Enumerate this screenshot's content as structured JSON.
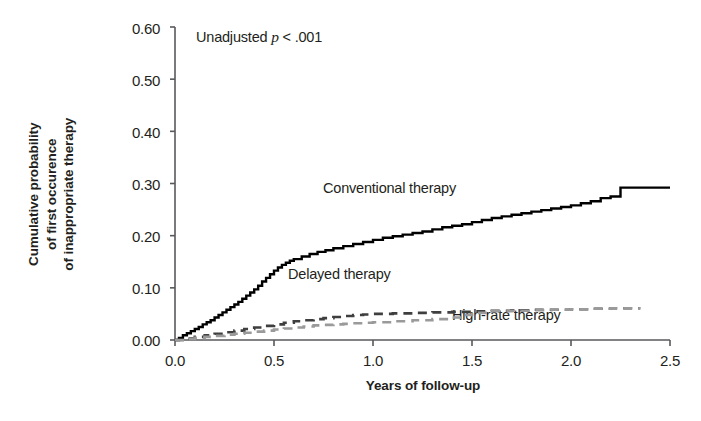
{
  "chart_data": {
    "type": "line",
    "title": "",
    "xlabel": "Years of follow-up",
    "ylabel": "Cumulative probability of first occurence of inappropriate therapy",
    "ylabel_lines": [
      "Cumulative probability",
      "of first occurence",
      "of inappropriate therapy"
    ],
    "xlim": [
      0.0,
      2.5
    ],
    "ylim": [
      0.0,
      0.6
    ],
    "xticks": [
      "0.0",
      "0.5",
      "1.0",
      "1.5",
      "2.0",
      "2.5"
    ],
    "xtick_values": [
      0.0,
      0.5,
      1.0,
      1.5,
      2.0,
      2.5
    ],
    "yticks": [
      "0.00",
      "0.10",
      "0.20",
      "0.30",
      "0.40",
      "0.50",
      "0.60"
    ],
    "ytick_values": [
      0.0,
      0.1,
      0.2,
      0.3,
      0.4,
      0.5,
      0.6
    ],
    "grid": false,
    "legend_position": "inline-annotations",
    "annotations": [
      {
        "id": "pvalue",
        "text_prefix": "Unadjusted ",
        "text_italic": "p",
        "text_suffix": " < .001"
      }
    ],
    "series": [
      {
        "name": "Conventional therapy",
        "style": "solid",
        "color": "#000000",
        "label_x": 1.27,
        "label_y": 0.335,
        "x": [
          0.0,
          0.02,
          0.04,
          0.06,
          0.08,
          0.1,
          0.12,
          0.14,
          0.16,
          0.18,
          0.2,
          0.22,
          0.24,
          0.26,
          0.28,
          0.3,
          0.32,
          0.34,
          0.36,
          0.38,
          0.4,
          0.42,
          0.44,
          0.46,
          0.48,
          0.5,
          0.52,
          0.54,
          0.56,
          0.58,
          0.6,
          0.64,
          0.68,
          0.72,
          0.76,
          0.8,
          0.85,
          0.9,
          0.95,
          1.0,
          1.05,
          1.1,
          1.15,
          1.2,
          1.25,
          1.3,
          1.35,
          1.4,
          1.45,
          1.5,
          1.55,
          1.6,
          1.65,
          1.7,
          1.75,
          1.8,
          1.85,
          1.9,
          1.95,
          2.0,
          2.05,
          2.1,
          2.15,
          2.2,
          2.25,
          2.5
        ],
        "y": [
          0.0,
          0.004,
          0.009,
          0.013,
          0.017,
          0.021,
          0.025,
          0.03,
          0.034,
          0.038,
          0.043,
          0.048,
          0.053,
          0.058,
          0.063,
          0.068,
          0.073,
          0.079,
          0.085,
          0.091,
          0.097,
          0.104,
          0.112,
          0.119,
          0.126,
          0.133,
          0.139,
          0.144,
          0.148,
          0.152,
          0.155,
          0.16,
          0.165,
          0.169,
          0.172,
          0.176,
          0.18,
          0.184,
          0.188,
          0.192,
          0.196,
          0.199,
          0.202,
          0.205,
          0.208,
          0.212,
          0.216,
          0.219,
          0.222,
          0.226,
          0.23,
          0.234,
          0.237,
          0.24,
          0.243,
          0.246,
          0.249,
          0.252,
          0.255,
          0.258,
          0.262,
          0.266,
          0.272,
          0.275,
          0.292,
          0.292
        ]
      },
      {
        "name": "Delayed therapy",
        "style": "dashed",
        "color": "#3f3f3f",
        "label_x": 0.71,
        "label_y": 0.092,
        "x": [
          0.0,
          0.05,
          0.1,
          0.15,
          0.2,
          0.25,
          0.3,
          0.35,
          0.4,
          0.45,
          0.5,
          0.55,
          0.6,
          0.65,
          0.7,
          0.75,
          0.8,
          0.85,
          0.9,
          0.95,
          1.0,
          1.1,
          1.2,
          1.3,
          1.4,
          1.5,
          1.6,
          1.7,
          1.8,
          1.9,
          2.0,
          2.1,
          2.2,
          2.35
        ],
        "y": [
          0.0,
          0.003,
          0.006,
          0.009,
          0.012,
          0.015,
          0.018,
          0.021,
          0.024,
          0.027,
          0.03,
          0.033,
          0.036,
          0.038,
          0.04,
          0.042,
          0.044,
          0.046,
          0.048,
          0.049,
          0.05,
          0.051,
          0.052,
          0.053,
          0.054,
          0.055,
          0.056,
          0.057,
          0.058,
          0.058,
          0.059,
          0.06,
          0.061,
          0.061
        ]
      },
      {
        "name": "High-rate therapy",
        "style": "dashed",
        "color": "#9a9a9a",
        "label_x": 1.6,
        "label_y": 0.029,
        "x": [
          0.0,
          0.05,
          0.1,
          0.15,
          0.2,
          0.25,
          0.3,
          0.35,
          0.4,
          0.45,
          0.5,
          0.55,
          0.6,
          0.65,
          0.7,
          0.75,
          0.8,
          0.85,
          0.9,
          0.95,
          1.0,
          1.1,
          1.2,
          1.3,
          1.4,
          1.45,
          1.5,
          1.6,
          1.7,
          1.8,
          1.9,
          2.0,
          2.1,
          2.2,
          2.35
        ],
        "y": [
          0.0,
          0.002,
          0.004,
          0.006,
          0.008,
          0.01,
          0.012,
          0.014,
          0.016,
          0.018,
          0.02,
          0.022,
          0.024,
          0.026,
          0.028,
          0.029,
          0.03,
          0.031,
          0.032,
          0.033,
          0.034,
          0.036,
          0.038,
          0.04,
          0.043,
          0.048,
          0.052,
          0.055,
          0.056,
          0.057,
          0.058,
          0.059,
          0.06,
          0.061,
          0.061
        ]
      }
    ]
  },
  "axes": {
    "ytick_labels": [
      "0.60",
      "0.50",
      "0.40",
      "0.30",
      "0.20",
      "0.10",
      "0.00"
    ],
    "xtick_labels": [
      "0.0",
      "0.5",
      "1.0",
      "1.5",
      "2.0",
      "2.5"
    ],
    "y_title_line1": "Cumulative probability",
    "y_title_line2": "of first occurence",
    "y_title_line3": "of inappropriate therapy",
    "x_title": "Years of follow-up"
  },
  "annotation": {
    "prefix": "Unadjusted ",
    "italic": "p",
    "suffix": " < .001"
  },
  "labels": {
    "conventional": "Conventional therapy",
    "delayed": "Delayed therapy",
    "highrate": "High-rate therapy"
  },
  "colors": {
    "axis": "#58595b",
    "conventional": "#000000",
    "delayed": "#3f3f3f",
    "highrate": "#9a9a9a",
    "text": "#231f20"
  }
}
